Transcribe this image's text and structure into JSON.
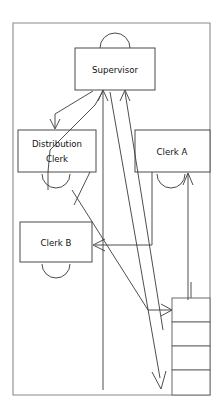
{
  "diagram": {
    "type": "flow-diagram",
    "frame": {
      "name": "outer-border",
      "x": 13,
      "y": 23,
      "width": 197,
      "height": 372,
      "stroke": "#8a8a8a"
    },
    "nodes": [
      {
        "id": "supervisor",
        "label": "Supervisor",
        "lines": [
          "Supervisor"
        ],
        "x": 75,
        "y": 48,
        "width": 80,
        "height": 42,
        "arc": "above"
      },
      {
        "id": "distribution-clerk",
        "label": "Distribution Clerk",
        "lines": [
          "Distribution",
          "Clerk"
        ],
        "x": 18,
        "y": 130,
        "width": 78,
        "height": 42,
        "arc": "below"
      },
      {
        "id": "clerk-a",
        "label": "Clerk A",
        "lines": [
          "Clerk  A"
        ],
        "x": 135,
        "y": 130,
        "width": 75,
        "height": 42,
        "arc": "below"
      },
      {
        "id": "clerk-b",
        "label": "Clerk B",
        "lines": [
          "Clerk B"
        ],
        "x": 20,
        "y": 222,
        "width": 72,
        "height": 40,
        "arc": "below"
      }
    ],
    "stack": {
      "id": "file-stack",
      "x": 172,
      "y": 298,
      "width": 38,
      "cell_height": 24,
      "cell_count": 4,
      "feed_line_x": 191,
      "feed_line_top": 282
    },
    "connections": [
      {
        "id": "supervisor-to-distribution-clerk",
        "from": "supervisor",
        "to": "distribution-clerk",
        "arrow": "down"
      },
      {
        "id": "distribution-clerk-to-supervisor",
        "from": "distribution-clerk",
        "to": "supervisor",
        "arrow": "up"
      },
      {
        "id": "clerk-a-to-clerk-b",
        "from": "clerk-a",
        "to": "clerk-b",
        "arrow": "left"
      },
      {
        "id": "stack-to-clerk-a",
        "from": "file-stack",
        "to": "clerk-a",
        "arrow": "up"
      },
      {
        "id": "clerk-b-to-stack",
        "from": "clerk-b",
        "to": "file-stack",
        "arrow": "right"
      },
      {
        "id": "supervisor-to-bottom",
        "from": "supervisor",
        "to": "bottom-exit",
        "arrow": "down"
      },
      {
        "id": "supervisor-diagonal-exit",
        "from": "supervisor",
        "to": "bottom-right-exit",
        "arrow": "down"
      }
    ],
    "colors": {
      "background": "#ffffff",
      "frame": "#8a8a8a",
      "box_stroke": "#4a4a4a",
      "line": "#3a3a3a",
      "text": "#111111"
    }
  }
}
